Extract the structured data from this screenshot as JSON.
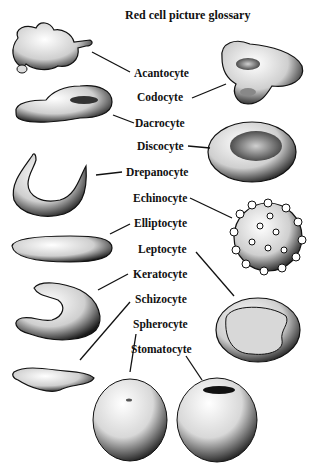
{
  "title": "Red cell picture glossary",
  "labels": [
    {
      "name": "Acantocyte"
    },
    {
      "name": "Codocyte"
    },
    {
      "name": "Dacrocyte"
    },
    {
      "name": "Discocyte"
    },
    {
      "name": "Drepanocyte"
    },
    {
      "name": "Echinocyte"
    },
    {
      "name": "Elliptocyte"
    },
    {
      "name": "Leptocyte"
    },
    {
      "name": "Keratocyte"
    },
    {
      "name": "Schizocyte"
    },
    {
      "name": "Spherocyte"
    },
    {
      "name": "Stomatocyte"
    }
  ]
}
